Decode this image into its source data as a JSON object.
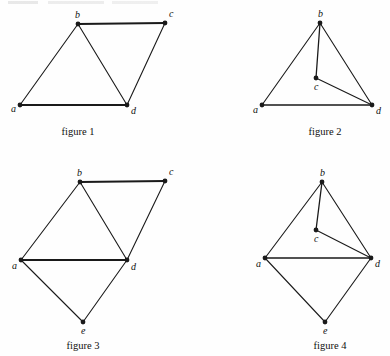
{
  "page": {
    "width": 390,
    "height": 356,
    "background": "#fefefe",
    "ink_color": "#1a1a1a"
  },
  "figures": [
    {
      "id": "figure-1",
      "caption": "figure 1",
      "caption_x": 78,
      "caption_y": 126,
      "origin_x": 0,
      "origin_y": 0,
      "width": 195,
      "height": 140,
      "vertices": [
        {
          "name": "a",
          "x": 20,
          "y": 105,
          "label_dx": -9,
          "label_dy": -1
        },
        {
          "name": "b",
          "x": 78,
          "y": 24,
          "label_dx": -3,
          "label_dy": -14
        },
        {
          "name": "c",
          "x": 165,
          "y": 23,
          "label_dx": 4,
          "label_dy": -14
        },
        {
          "name": "d",
          "x": 127,
          "y": 105,
          "label_dx": 4,
          "label_dy": 1
        }
      ],
      "edges": [
        {
          "from": "a",
          "to": "b",
          "weight": 1.1
        },
        {
          "from": "b",
          "to": "c",
          "weight": 1.8
        },
        {
          "from": "b",
          "to": "d",
          "weight": 1.1
        },
        {
          "from": "c",
          "to": "d",
          "weight": 1.1
        },
        {
          "from": "a",
          "to": "d",
          "weight": 1.8
        }
      ]
    },
    {
      "id": "figure-2",
      "caption": "figure 2",
      "caption_x": 325,
      "caption_y": 126,
      "origin_x": 195,
      "origin_y": 0,
      "width": 195,
      "height": 140,
      "vertices": [
        {
          "name": "a",
          "x": 262,
          "y": 105,
          "label_dx": -9,
          "label_dy": 0
        },
        {
          "name": "b",
          "x": 320,
          "y": 23,
          "label_dx": -2,
          "label_dy": -14
        },
        {
          "name": "c",
          "x": 316,
          "y": 78,
          "label_dx": -2,
          "label_dy": 4
        },
        {
          "name": "d",
          "x": 372,
          "y": 105,
          "label_dx": 4,
          "label_dy": 1
        }
      ],
      "edges": [
        {
          "from": "a",
          "to": "b",
          "weight": 1.1
        },
        {
          "from": "b",
          "to": "d",
          "weight": 1.1
        },
        {
          "from": "a",
          "to": "d",
          "weight": 1.5
        },
        {
          "from": "b",
          "to": "c",
          "weight": 1.3
        },
        {
          "from": "c",
          "to": "d",
          "weight": 1.1
        }
      ]
    },
    {
      "id": "figure-3",
      "caption": "figure 3",
      "caption_x": 83,
      "caption_y": 340,
      "origin_x": 0,
      "origin_y": 150,
      "width": 195,
      "height": 206,
      "vertices": [
        {
          "name": "a",
          "x": 21,
          "y": 260,
          "label_dx": -9,
          "label_dy": 1
        },
        {
          "name": "b",
          "x": 80,
          "y": 182,
          "label_dx": -3,
          "label_dy": -14
        },
        {
          "name": "c",
          "x": 165,
          "y": 181,
          "label_dx": 4,
          "label_dy": -14
        },
        {
          "name": "d",
          "x": 127,
          "y": 260,
          "label_dx": 4,
          "label_dy": 2
        },
        {
          "name": "e",
          "x": 83,
          "y": 322,
          "label_dx": -2,
          "label_dy": 4
        }
      ],
      "edges": [
        {
          "from": "a",
          "to": "b",
          "weight": 1.1
        },
        {
          "from": "b",
          "to": "c",
          "weight": 1.8
        },
        {
          "from": "b",
          "to": "d",
          "weight": 1.1
        },
        {
          "from": "c",
          "to": "d",
          "weight": 1.1
        },
        {
          "from": "a",
          "to": "d",
          "weight": 1.8
        },
        {
          "from": "a",
          "to": "e",
          "weight": 1.1
        },
        {
          "from": "d",
          "to": "e",
          "weight": 1.1
        }
      ]
    },
    {
      "id": "figure-4",
      "caption": "figure 4",
      "caption_x": 330,
      "caption_y": 340,
      "origin_x": 195,
      "origin_y": 150,
      "width": 195,
      "height": 206,
      "vertices": [
        {
          "name": "a",
          "x": 265,
          "y": 258,
          "label_dx": -9,
          "label_dy": 1
        },
        {
          "name": "b",
          "x": 322,
          "y": 182,
          "label_dx": -2,
          "label_dy": -14
        },
        {
          "name": "c",
          "x": 316,
          "y": 230,
          "label_dx": -2,
          "label_dy": 4
        },
        {
          "name": "d",
          "x": 371,
          "y": 258,
          "label_dx": 4,
          "label_dy": 1
        },
        {
          "name": "e",
          "x": 325,
          "y": 322,
          "label_dx": -2,
          "label_dy": 4
        }
      ],
      "edges": [
        {
          "from": "a",
          "to": "b",
          "weight": 1.1
        },
        {
          "from": "b",
          "to": "d",
          "weight": 1.1
        },
        {
          "from": "a",
          "to": "d",
          "weight": 1.4
        },
        {
          "from": "b",
          "to": "c",
          "weight": 1.3
        },
        {
          "from": "c",
          "to": "d",
          "weight": 1.1
        },
        {
          "from": "a",
          "to": "e",
          "weight": 1.1
        },
        {
          "from": "d",
          "to": "e",
          "weight": 1.1
        }
      ]
    }
  ]
}
